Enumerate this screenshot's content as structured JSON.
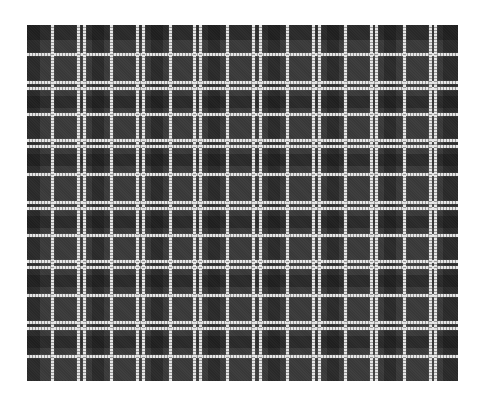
{
  "image": {
    "subject": "black and white plaid fabric swatch",
    "background_color": "#ffffff",
    "swatch": {
      "left": 27,
      "top": 25,
      "width": 431,
      "height": 356
    },
    "colors": {
      "base": "#3a3a3a",
      "dark_block": "#262626",
      "line": "#e8e8e8"
    },
    "vertical_lines": [
      52,
      78,
      84,
      111,
      137,
      143,
      170,
      194,
      200,
      227,
      253,
      260,
      287,
      313,
      319,
      345,
      371,
      376,
      404,
      430,
      435
    ],
    "horizontal_lines": [
      54,
      82,
      88,
      114,
      140,
      146,
      174,
      202,
      208,
      235,
      261,
      267,
      295,
      322,
      328,
      356
    ],
    "dark_bands_x": [
      [
        27,
        40
      ],
      [
        92,
        104
      ],
      [
        151,
        163
      ],
      [
        208,
        220
      ],
      [
        268,
        280
      ],
      [
        327,
        339
      ],
      [
        384,
        396
      ],
      [
        443,
        458
      ]
    ],
    "dark_bands_y": [
      [
        25,
        40
      ],
      [
        96,
        108
      ],
      [
        154,
        166
      ],
      [
        216,
        228
      ],
      [
        275,
        287
      ],
      [
        336,
        348
      ]
    ]
  }
}
